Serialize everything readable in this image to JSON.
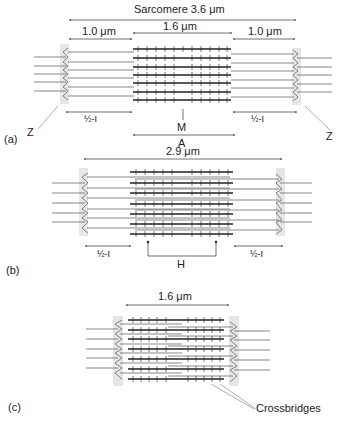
{
  "panels": {
    "a": {
      "label": "(a)",
      "sarcomere": "Sarcomere 3.6 μm",
      "left_dim": "1.0 μm",
      "center_dim": "1.6 μm",
      "right_dim": "1.0 μm",
      "half_i_left": "½-I",
      "half_i_right": "½-I",
      "m_label": "M",
      "a_label": "A",
      "z_left": "Z",
      "z_right": "Z"
    },
    "b": {
      "label": "(b)",
      "length": "2.9 μm",
      "half_i_left": "½-I",
      "half_i_right": "½-I",
      "h_label": "H"
    },
    "c": {
      "label": "(c)",
      "length": "1.6 μm",
      "crossbridges": "Crossbridges"
    }
  },
  "colors": {
    "line": "#333333",
    "zdisc": "#e6e6e6",
    "text": "#222222"
  }
}
